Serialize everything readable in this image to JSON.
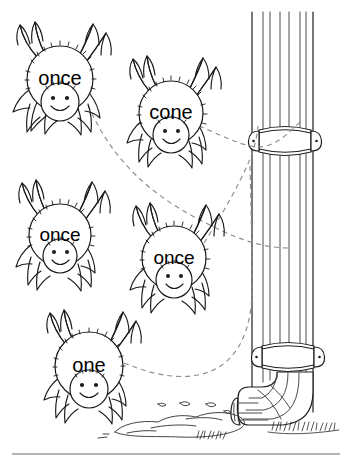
{
  "page": {
    "background_color": "#ffffff",
    "width": 351,
    "height": 464,
    "ink_color": "#1a1a1a",
    "web_line_color": "#8d8d8d",
    "pipe_line_color": "#4a4a4a",
    "footer_rule_color": "#b4b4b4"
  },
  "illustration": {
    "name": "spiders-climbing-drainpipe",
    "description": "Five cartoon spiders with word labels on their bodies, connected by dashed web strands to a vertical rain drainpipe with mounting brackets, an elbow at the bottom, a water puddle and grass."
  },
  "spiders": [
    {
      "id": "spider-1",
      "word": "once",
      "cx": 60,
      "cy": 79,
      "r": 33,
      "word_font_size": 20
    },
    {
      "id": "spider-2",
      "word": "cone",
      "cx": 171,
      "cy": 113,
      "r": 32,
      "word_font_size": 20
    },
    {
      "id": "spider-3",
      "word": "once",
      "cx": 60,
      "cy": 235,
      "r": 31,
      "word_font_size": 19
    },
    {
      "id": "spider-4",
      "word": "once",
      "cx": 174,
      "cy": 258,
      "r": 32,
      "word_font_size": 19
    },
    {
      "id": "spider-5",
      "word": "one",
      "cx": 89,
      "cy": 366,
      "r": 34,
      "word_font_size": 20
    }
  ],
  "web_strands": [
    {
      "id": "strand-1",
      "from": "spider-1",
      "to": "drainpipe"
    },
    {
      "id": "strand-2",
      "from": "spider-2",
      "to": "drainpipe"
    },
    {
      "id": "strand-3",
      "from": "spider-4",
      "to": "drainpipe"
    },
    {
      "id": "strand-4",
      "from": "spider-5",
      "to": "drainpipe"
    }
  ],
  "drainpipe": {
    "name": "drainpipe",
    "brackets": [
      {
        "id": "bracket-upper",
        "y": 136
      },
      {
        "id": "bracket-lower",
        "y": 352
      }
    ],
    "elbow": {
      "id": "pipe-elbow",
      "direction": "left"
    }
  },
  "ground": {
    "puddle": "water-puddle",
    "grass": "grass-tufts"
  }
}
